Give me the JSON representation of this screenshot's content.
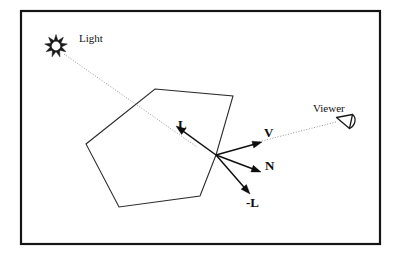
{
  "figure": {
    "background_color": "#ffffff",
    "frame": {
      "name": "diagram-border",
      "x": 21,
      "y": 11,
      "width": 359,
      "height": 233,
      "stroke_color": "#151515"
    }
  },
  "labels": {
    "light": "Light",
    "viewer": "Viewer",
    "vector_l": "L",
    "vector_v": "V",
    "vector_n": "N",
    "vector_neg_l": "-L"
  },
  "label_positions": {
    "light": {
      "x": 79,
      "y": 42
    },
    "viewer": {
      "x": 313,
      "y": 112
    },
    "vector_l": {
      "x": 178,
      "y": 129
    },
    "vector_v": {
      "x": 264,
      "y": 137
    },
    "vector_n": {
      "x": 265,
      "y": 170
    },
    "vector_neg_l": {
      "x": 246,
      "y": 207
    }
  },
  "light_source": {
    "name": "sun-icon",
    "center_x": 56,
    "center_y": 46,
    "core_radius": 5.2,
    "ray_count": 9,
    "ray_inner": 5.6,
    "ray_outer": 11.5,
    "color": "#1a1a1a"
  },
  "viewer_source": {
    "name": "eye-icon",
    "center_x": 345,
    "center_y": 124,
    "color": "#1b1b1b",
    "path": "M 337 118 L 352 115 L 350 127 Z"
  },
  "surface_polygon": {
    "name": "surface-polygon",
    "stroke_color": "#2b2b2b",
    "points": [
      {
        "x": 155,
        "y": 89
      },
      {
        "x": 233,
        "y": 96
      },
      {
        "x": 216,
        "y": 155
      },
      {
        "x": 200,
        "y": 196
      },
      {
        "x": 119,
        "y": 207
      },
      {
        "x": 86,
        "y": 144
      }
    ]
  },
  "origin_point": {
    "x": 216,
    "y": 155
  },
  "vectors": [
    {
      "id": "L",
      "name": "vector-L",
      "label": "L",
      "description": "unit vector toward the light source",
      "from": {
        "x": 216,
        "y": 155
      },
      "to": {
        "x": 176,
        "y": 126
      },
      "color": "#111111"
    },
    {
      "id": "V",
      "name": "vector-V",
      "label": "V",
      "description": "unit vector toward the viewer",
      "from": {
        "x": 216,
        "y": 155
      },
      "to": {
        "x": 262,
        "y": 142
      },
      "color": "#111111"
    },
    {
      "id": "N",
      "name": "vector-N",
      "label": "N",
      "description": "surface normal vector",
      "from": {
        "x": 216,
        "y": 155
      },
      "to": {
        "x": 261,
        "y": 172
      },
      "color": "#111111"
    },
    {
      "id": "-L",
      "name": "vector-negative-L",
      "label": "-L",
      "description": "reversed light vector",
      "from": {
        "x": 216,
        "y": 155
      },
      "to": {
        "x": 250,
        "y": 194
      },
      "color": "#111111"
    }
  ],
  "rays": [
    {
      "id": "light-ray",
      "name": "light-ray-dotted",
      "description": "dotted incident ray from the light source through the surface point",
      "from": {
        "x": 64,
        "y": 54
      },
      "to": {
        "x": 197,
        "y": 147
      },
      "color": "#8d8d8d"
    },
    {
      "id": "view-ray",
      "name": "viewer-ray-dotted",
      "description": "dotted sight line from the viewer to the surface point",
      "from": {
        "x": 336,
        "y": 122
      },
      "to": {
        "x": 258,
        "y": 142
      },
      "color": "#8d8d8d"
    }
  ]
}
